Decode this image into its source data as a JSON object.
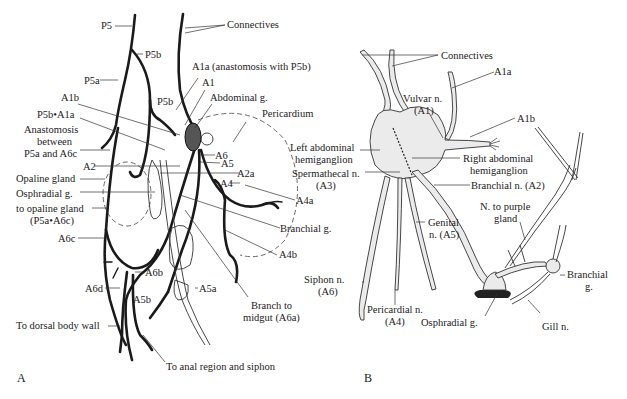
{
  "figure": {
    "panels": [
      {
        "id": "A",
        "letter": "A",
        "labels": {
          "p5": "P5",
          "connectives": "Connectives",
          "p5b_top": "P5b",
          "p5a": "P5a",
          "a1a": "A1a  (anastomosis with P5b)",
          "a1": "A1",
          "a1b": "A1b",
          "p5b_mid": "P5b",
          "abdominal_g": "Abdominal g.",
          "p5b_a1a": "P5b•A1a",
          "pericardium": "Pericardium",
          "anastomosis_1": "Anastomosis",
          "anastomosis_2": "between",
          "anastomosis_3": "P5a and A6c",
          "a6": "A6",
          "a5": "A5",
          "a2": "A2",
          "a2a": "A2a",
          "opaline_gland": "Opaline gland",
          "a4": "A4",
          "osphradial_g": "Osphradial g.",
          "a4a": "A4a",
          "to_opaline_1": "to opaline gland",
          "to_opaline_2": "(P5a•A6c)",
          "branchial_g": "Branchial g.",
          "a6c": "A6c",
          "a4b": "A4b",
          "a6b": "A6b",
          "a6d": "A6d",
          "a5a": "A5a",
          "a5b": "A5b",
          "branch_midgut_1": "Branch to",
          "branch_midgut_2": "midgut (A6a)",
          "to_dorsal": "To dorsal body wall",
          "to_anal": "To anal region and siphon"
        }
      },
      {
        "id": "B",
        "letter": "B",
        "labels": {
          "connectives": "Connectives",
          "a1a": "A1a",
          "vulvar_1": "Vulvar n.",
          "vulvar_2": "(A1)",
          "a1b": "A1b",
          "left_hemi_1": "Left abdominal",
          "left_hemi_2": "hemiganglion",
          "right_hemi_1": "Right abdominal",
          "right_hemi_2": "hemiganglion",
          "spermathecal_1": "Spermathecal n.",
          "spermathecal_2": "(A3)",
          "branchial_n": "Branchial n. (A2)",
          "genital_1": "Genital",
          "genital_2": "n. (A5)",
          "purple_1": "N. to purple",
          "purple_2": "gland",
          "siphon_1": "Siphon n.",
          "siphon_2": "(A6)",
          "branchial_g_1": "Branchial",
          "branchial_g_2": "g.",
          "pericardial_1": "Pericardial n.",
          "pericardial_2": "(A4)",
          "osphradial_g": "Osphradial g.",
          "gill_n": "Gill n."
        }
      }
    ]
  }
}
